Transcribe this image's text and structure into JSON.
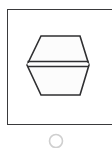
{
  "figure": {
    "title": "",
    "background_color": "#ffffff",
    "frame": {
      "label": "diagram frame",
      "stroke_color": "#3a3a3c",
      "fill_color": "#ffffff",
      "stroke_width": "1.5",
      "x": 7,
      "y": 9,
      "width": 112,
      "height": 116,
      "cropped_right": "true"
    },
    "hexagon": {
      "label": "split hexagon",
      "stroke_color": "#2f2f31",
      "fill_color": "#fcfcfc",
      "stroke_width": "1.6",
      "center_x": 58,
      "center_y": 65,
      "half_width": 31,
      "half_height": 30,
      "top_edge_y": 36,
      "bottom_edge_y": 95,
      "left_vertex_x": 27,
      "right_vertex_x": 89,
      "divider": {
        "label": "horizontal split line",
        "upper_line_y": 61.5,
        "lower_line_y": 66.5,
        "gap_fill": "#ffffff"
      }
    },
    "circle_marker": {
      "label": "circle outline clipped by bottom edge",
      "stroke_color": "#cfcfcf",
      "fill_color": "none",
      "stroke_width": "1.6",
      "center_x": 56,
      "center_y": 141,
      "radius": 6.5
    }
  }
}
